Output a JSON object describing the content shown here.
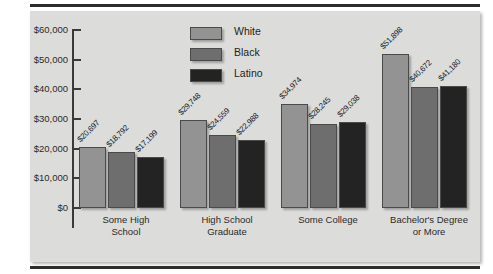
{
  "chart_data": {
    "type": "bar",
    "title": "",
    "xlabel": "",
    "ylabel": "",
    "ylim": [
      0,
      60000
    ],
    "grid": false,
    "legend_position": "top-center",
    "categories": [
      "Some High\nSchool",
      "High School\nGraduate",
      "Some College",
      "Bachelor's Degree\nor More"
    ],
    "ytick_labels": [
      "$60,000",
      "$50,000",
      "$40,000",
      "$30,000",
      "$20,000",
      "$10,000",
      "$0"
    ],
    "ytick_values": [
      60000,
      50000,
      40000,
      30000,
      20000,
      10000,
      0
    ],
    "series": [
      {
        "name": "White",
        "color": "#939393",
        "values": [
          20697,
          29748,
          34974,
          51898
        ],
        "labels": [
          "$20,697",
          "$29,748",
          "$34,974",
          "$51,898"
        ]
      },
      {
        "name": "Black",
        "color": "#6e6e6e",
        "values": [
          18792,
          24559,
          28245,
          40672
        ],
        "labels": [
          "$18,792",
          "$24,559",
          "$28,245",
          "$40,672"
        ]
      },
      {
        "name": "Latino",
        "color": "#232323",
        "values": [
          17199,
          22988,
          29038,
          41180
        ],
        "labels": [
          "$17,199",
          "$22,988",
          "$29,038",
          "$41,180"
        ]
      }
    ]
  },
  "colors": {
    "panel_background": "#dcdcda",
    "rule": "#2c2c2c",
    "axis": "#3a3a3a",
    "text": "#1e1e1e"
  }
}
